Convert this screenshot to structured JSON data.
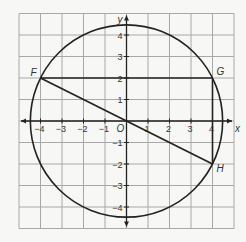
{
  "figure": {
    "grid": {
      "min": -5,
      "max": 5,
      "step": 1,
      "line_color": "#a8a8a8",
      "background": "#f7f7f5"
    },
    "axes": {
      "x_label": "x",
      "y_label": "y",
      "origin_label": "O",
      "x_ticks": [
        "-4",
        "-3",
        "-2",
        "-1",
        "1",
        "2",
        "3",
        "4"
      ],
      "y_ticks": [
        "4",
        "3",
        "2",
        "1",
        "-1",
        "-2",
        "-3",
        "-4"
      ],
      "x_tick_values": [
        -4,
        -3,
        -2,
        -1,
        1,
        2,
        3,
        4
      ],
      "y_tick_values": [
        4,
        3,
        2,
        1,
        -1,
        -2,
        -3,
        -4
      ],
      "color": "#222222"
    },
    "circle": {
      "center": [
        0,
        0
      ],
      "radius": 4.472,
      "color": "#222222"
    },
    "points": [
      {
        "label": "F",
        "x": -4,
        "y": 2
      },
      {
        "label": "G",
        "x": 4,
        "y": 2
      },
      {
        "label": "H",
        "x": 4,
        "y": -2
      }
    ],
    "segments": [
      {
        "from": "F",
        "to": "G"
      },
      {
        "from": "F",
        "to": "H"
      },
      {
        "from": "G",
        "to": "H"
      }
    ]
  }
}
